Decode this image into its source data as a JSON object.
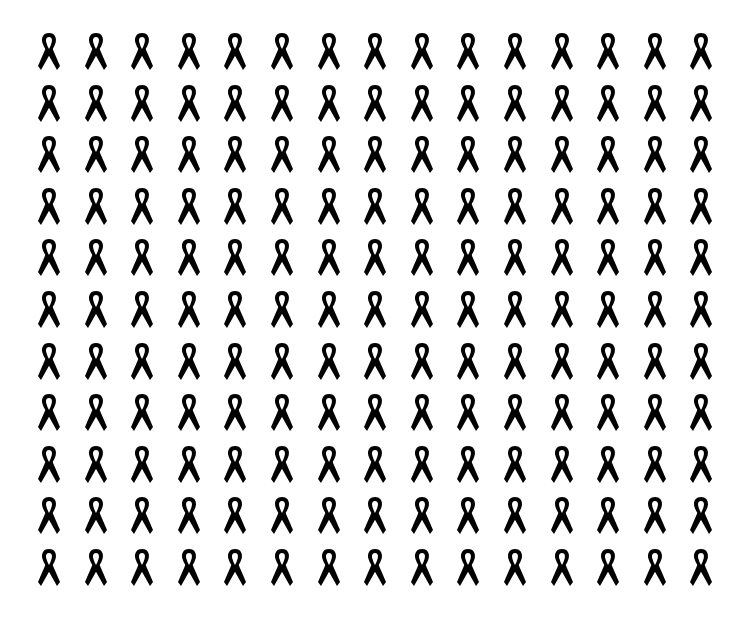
{
  "figure": {
    "icon": "awareness-ribbon-icon",
    "rows": 11,
    "columns": 15,
    "total_icons": 165,
    "icon_color": "#000000",
    "background_color": "#ffffff",
    "origin": {
      "x": 36,
      "y": 30
    },
    "spacing": {
      "x": 46.6,
      "y": 51.6
    }
  }
}
